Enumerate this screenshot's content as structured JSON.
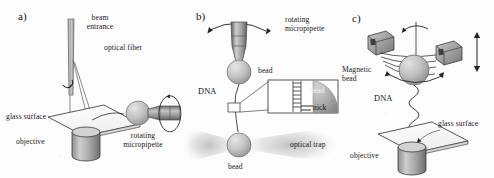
{
  "figure": {
    "background_color": "#fdfdfd",
    "ink_color": "#1a1a1a",
    "bead_color": "#b9b9b9",
    "metal_color": "#8e8e8e",
    "trap_color": "#c9c9c9"
  },
  "panels": [
    {
      "id": "a",
      "label": "a)",
      "name": "optical-fiber-trap-setup",
      "annotations": [
        {
          "id": "beam-entrance",
          "text": "beam\nentrance",
          "line1": "beam",
          "line2": "entrance"
        },
        {
          "id": "optical-fiber",
          "text": "optical fiber",
          "line1": "optical fiber",
          "line2": ""
        },
        {
          "id": "glass-surface",
          "text": "glass surface",
          "line1": "glass surface",
          "line2": ""
        },
        {
          "id": "objective",
          "text": "objective",
          "line1": "objective",
          "line2": ""
        },
        {
          "id": "rotating-micropipette",
          "text": "rotating\nmicropipette",
          "line1": "rotating",
          "line2": "micropipette"
        }
      ]
    },
    {
      "id": "b",
      "label": "b)",
      "name": "optical-trap-micropipette-setup",
      "annotations": [
        {
          "id": "rotating-micropipette",
          "text": "rotating\nmicropipette",
          "line1": "rotating",
          "line2": "micropipette"
        },
        {
          "id": "bead-top",
          "text": "bead",
          "line1": "bead",
          "line2": ""
        },
        {
          "id": "dna",
          "text": "DNA",
          "line1": "DNA",
          "line2": ""
        },
        {
          "id": "inset-bead",
          "text": "bead",
          "line1": "bead",
          "line2": ""
        },
        {
          "id": "nick",
          "text": "nick",
          "line1": "nick",
          "line2": ""
        },
        {
          "id": "optical-trap",
          "text": "optical trap",
          "line1": "optical trap",
          "line2": ""
        },
        {
          "id": "bead-bottom",
          "text": "bead",
          "line1": "bead",
          "line2": ""
        }
      ]
    },
    {
      "id": "c",
      "label": "c)",
      "name": "magnetic-tweezers-setup",
      "annotations": [
        {
          "id": "magnetic-bead",
          "text": "Magnetic\nbead",
          "line1": "Magnetic",
          "line2": "bead"
        },
        {
          "id": "dna",
          "text": "DNA",
          "line1": "DNA",
          "line2": ""
        },
        {
          "id": "glass-surface",
          "text": "glass surface",
          "line1": "glass surface",
          "line2": ""
        },
        {
          "id": "objective",
          "text": "objective",
          "line1": "objective",
          "line2": ""
        }
      ]
    }
  ]
}
